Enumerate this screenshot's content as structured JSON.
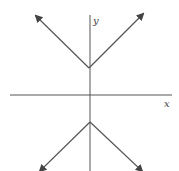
{
  "diagram": {
    "type": "graph",
    "axes": {
      "x_label": "x",
      "y_label": "y"
    },
    "colors": {
      "line": "#555555",
      "axis": "#555555",
      "background": "#ffffff"
    },
    "curves": [
      {
        "name": "upper-v",
        "vertex": [
          89,
          68
        ],
        "ends": [
          [
            35,
            16
          ],
          [
            143,
            14
          ]
        ],
        "arrows": true
      },
      {
        "name": "lower-v",
        "vertex": [
          90,
          122
        ],
        "ends": [
          [
            38,
            174
          ],
          [
            142,
            174
          ]
        ],
        "arrows": true
      }
    ]
  }
}
